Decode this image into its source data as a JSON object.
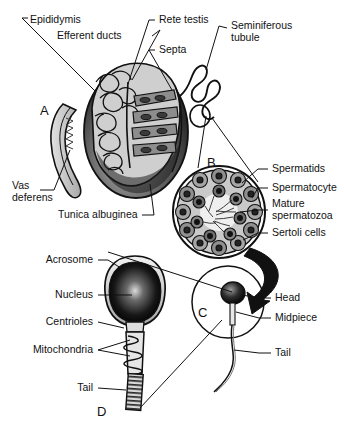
{
  "figure": {
    "background_color": "#ffffff",
    "line_color": "#111111",
    "width": 344,
    "height": 430
  },
  "panels": [
    {
      "id": "A",
      "letter": "A",
      "caption": "Testis, epididymis and vas deferens",
      "x": 40,
      "y": 110
    },
    {
      "id": "B",
      "letter": "B",
      "caption": "Seminiferous tubule cross section",
      "x": 208,
      "y": 162
    },
    {
      "id": "C",
      "letter": "C",
      "caption": "Whole spermatozoon",
      "x": 199,
      "y": 312
    },
    {
      "id": "D",
      "letter": "D",
      "caption": "Spermatozoon detail",
      "x": 98,
      "y": 412
    }
  ],
  "labels": {
    "panel_a": [
      {
        "text": "Epididymis",
        "x": 30,
        "y": 14,
        "align": "left"
      },
      {
        "text": "Efferent ducts",
        "x": 57,
        "y": 34,
        "align": "left"
      },
      {
        "text": "Rete testis",
        "x": 157,
        "y": 14,
        "align": "left"
      },
      {
        "text": "Septa",
        "x": 157,
        "y": 44,
        "align": "left"
      },
      {
        "text": "Seminiferous\ntubule",
        "x": 229,
        "y": 22,
        "align": "left"
      },
      {
        "text": "Vas\ndeferens",
        "x": 13,
        "y": 186,
        "align": "left"
      },
      {
        "text": "Tunica albuginea",
        "x": 60,
        "y": 211,
        "align": "left"
      }
    ],
    "panel_b": [
      {
        "text": "Spermatids",
        "x": 270,
        "y": 164,
        "align": "left"
      },
      {
        "text": "Spermatocyte",
        "x": 270,
        "y": 183,
        "align": "left"
      },
      {
        "text": "Mature\nspermatozoa",
        "x": 270,
        "y": 198,
        "align": "left"
      },
      {
        "text": "Sertoli cells",
        "x": 270,
        "y": 228,
        "align": "left"
      }
    ],
    "panel_c": [
      {
        "text": "Head",
        "x": 273,
        "y": 293,
        "align": "left"
      },
      {
        "text": "Midpiece",
        "x": 273,
        "y": 313,
        "align": "left"
      },
      {
        "text": "Tail",
        "x": 273,
        "y": 348,
        "align": "left"
      }
    ],
    "panel_d": [
      {
        "text": "Acrosome",
        "x": 95,
        "y": 256,
        "align": "right"
      },
      {
        "text": "Nucleus",
        "x": 95,
        "y": 291,
        "align": "right"
      },
      {
        "text": "Centrioles",
        "x": 95,
        "y": 318,
        "align": "right"
      },
      {
        "text": "Mitochondria",
        "x": 95,
        "y": 346,
        "align": "right"
      },
      {
        "text": "Tail",
        "x": 95,
        "y": 384,
        "align": "right"
      }
    ]
  }
}
